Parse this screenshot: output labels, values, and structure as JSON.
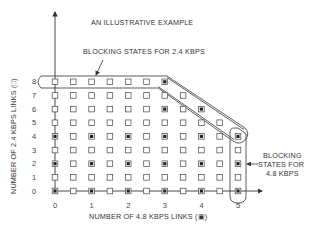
{
  "title": "AN ILLUSTRATIVE EXAMPLE",
  "annotations": {
    "blocking_2_4": "BLOCKING STATES FOR 2.4 KBPS",
    "blocking_4_8_lines": [
      "BLOCKING",
      "STATES FOR",
      "4.8 KBPS"
    ]
  },
  "axes": {
    "x_label": "NUMBER OF 4.8 KBPS LINKS (▣)",
    "y_label": "NUMBER OF 2.4 KBPS LINKS (□)",
    "x_ticks": [
      "0",
      "1",
      "2",
      "3",
      "4",
      "5"
    ],
    "y_ticks": [
      "0",
      "1",
      "2",
      "3",
      "4",
      "5",
      "6",
      "7",
      "8"
    ]
  },
  "legend": {
    "empty_square": "2.4 KBPS link state",
    "filled_square": "4.8 KBPS link state"
  },
  "grid": {
    "columns": 11,
    "rows": 9,
    "max_col_per_row": [
      10,
      10,
      10,
      10,
      10,
      9,
      8,
      7,
      6
    ],
    "filled_points": [
      [
        0,
        0
      ],
      [
        2,
        0
      ],
      [
        4,
        0
      ],
      [
        6,
        0
      ],
      [
        8,
        0
      ],
      [
        10,
        0
      ],
      [
        0,
        2
      ],
      [
        2,
        2
      ],
      [
        4,
        2
      ],
      [
        6,
        2
      ],
      [
        8,
        2
      ],
      [
        10,
        2
      ],
      [
        0,
        4
      ],
      [
        2,
        4
      ],
      [
        4,
        4
      ],
      [
        6,
        4
      ],
      [
        8,
        4
      ],
      [
        10,
        4
      ],
      [
        6,
        6
      ],
      [
        8,
        6
      ],
      [
        6,
        8
      ]
    ]
  },
  "colors": {
    "ink": "#333333",
    "background": "#ffffff"
  }
}
